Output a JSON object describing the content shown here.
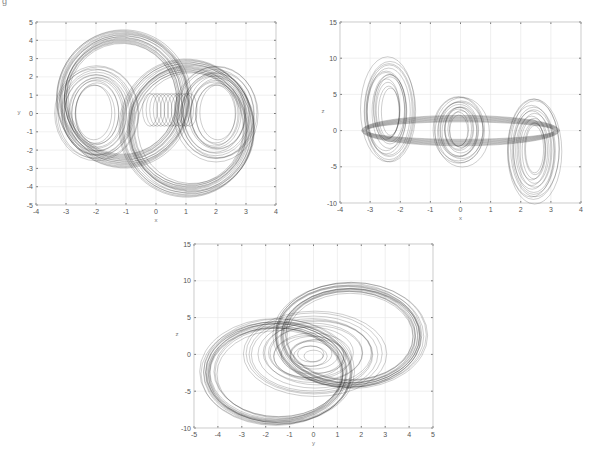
{
  "figure_label": "g",
  "chart_data": [
    {
      "type": "line",
      "title": "",
      "xlabel": "x",
      "ylabel": "y",
      "xlim": [
        -4,
        4
      ],
      "ylim": [
        -5,
        5
      ],
      "xticks": [
        -4,
        -3,
        -2,
        -1,
        0,
        1,
        2,
        3,
        4
      ],
      "yticks": [
        -5,
        -4,
        -3,
        -2,
        -1,
        0,
        1,
        2,
        3,
        4,
        5
      ],
      "grid": true,
      "description": "Double-scroll chaotic attractor projection on x-y plane: two spiral lobes centered near (-2,0) and (2,0), outer orbits reaching y≈±4.5 and x≈±3.3",
      "lobes": [
        {
          "center": [
            -2.0,
            0.0
          ],
          "inner_rx": 0.6,
          "inner_ry": 1.5,
          "outer_rx": 1.4,
          "outer_ry": 2.6
        },
        {
          "center": [
            2.0,
            0.0
          ],
          "inner_rx": 0.6,
          "inner_ry": 1.5,
          "outer_rx": 1.4,
          "outer_ry": 2.6
        }
      ],
      "outer_loops": [
        {
          "center": [
            -1.1,
            0.8
          ],
          "rx": 2.2,
          "ry": 3.7
        },
        {
          "center": [
            1.1,
            -0.8
          ],
          "rx": 2.2,
          "ry": 3.7
        }
      ]
    },
    {
      "type": "line",
      "title": "",
      "xlabel": "x",
      "ylabel": "z",
      "xlim": [
        -4,
        4
      ],
      "ylim": [
        -10,
        15
      ],
      "xticks": [
        -4,
        -3,
        -2,
        -1,
        0,
        1,
        2,
        3,
        4
      ],
      "yticks": [
        -10,
        -5,
        0,
        5,
        10,
        15
      ],
      "grid": true,
      "description": "Attractor projection on x-z plane: diagonal band of three tilted loops from (-3,10) down to (3,-10), lobes near x=-2.5, x=0, x=2.5",
      "lobes": [
        {
          "center": [
            -2.4,
            0.5
          ],
          "z_range": [
            -4.5,
            10
          ]
        },
        {
          "center": [
            0.0,
            0.0
          ],
          "z_range": [
            -4.8,
            4.8
          ]
        },
        {
          "center": [
            2.4,
            -0.5
          ],
          "z_range": [
            -10,
            4.5
          ]
        }
      ]
    },
    {
      "type": "line",
      "title": "",
      "xlabel": "y",
      "ylabel": "z",
      "xlim": [
        -5,
        5
      ],
      "ylim": [
        -10,
        15
      ],
      "xticks": [
        -5,
        -4,
        -3,
        -2,
        -1,
        0,
        1,
        2,
        3,
        4,
        5
      ],
      "yticks": [
        -10,
        -5,
        0,
        5,
        10,
        15
      ],
      "grid": true,
      "description": "Attractor projection on y-z plane: two large tilted ellipses (one upper-right reaching y≈4.5,z≈10; one lower-left reaching y≈-4.5,z≈-9.5) with dense central loops around origin",
      "outer_loops": [
        {
          "center": [
            1.5,
            2.5
          ],
          "rx": 3.1,
          "rz": 7.0
        },
        {
          "center": [
            -1.5,
            -2.5
          ],
          "rx": 3.1,
          "rz": 7.0
        }
      ],
      "inner_loop": {
        "center": [
          0.0,
          0.0
        ],
        "rx": 2.6,
        "rz": 5.0
      }
    }
  ]
}
